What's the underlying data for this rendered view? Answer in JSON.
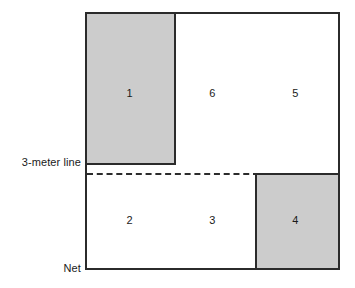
{
  "diagram": {
    "court": {
      "boundary_color": "#2b2b2b",
      "fill_color": "#ffffff"
    },
    "shaded_color": "#cccccc",
    "zones": [
      {
        "id": "zone-1",
        "label": "1",
        "shaded": true,
        "row": "back",
        "x_pct": 17,
        "y_pct": 31
      },
      {
        "id": "zone-6",
        "label": "6",
        "shaded": false,
        "row": "back",
        "x_pct": 50,
        "y_pct": 31
      },
      {
        "id": "zone-5",
        "label": "5",
        "shaded": false,
        "row": "back",
        "x_pct": 83,
        "y_pct": 31
      },
      {
        "id": "zone-2",
        "label": "2",
        "shaded": false,
        "row": "front",
        "x_pct": 17,
        "y_pct": 81
      },
      {
        "id": "zone-3",
        "label": "3",
        "shaded": false,
        "row": "front",
        "x_pct": 50,
        "y_pct": 81
      },
      {
        "id": "zone-4",
        "label": "4",
        "shaded": true,
        "row": "front",
        "x_pct": 83,
        "y_pct": 81
      }
    ],
    "annotations": {
      "three_meter_line": "3-meter line",
      "net": "Net"
    }
  }
}
